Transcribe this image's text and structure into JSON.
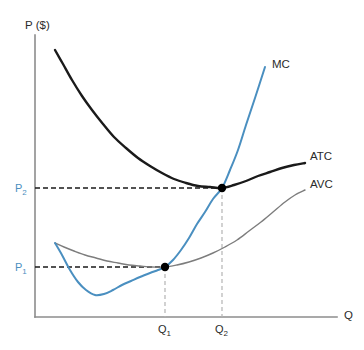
{
  "chart_data": {
    "type": "line",
    "title": "",
    "xlabel": "Q",
    "ylabel": "P ($)",
    "grid": false,
    "legend_position": "inline-right-of-curve-ends",
    "axis_labels": {
      "y_axis": "P ($)",
      "x_axis": "Q"
    },
    "tick_labels": {
      "y": [
        "P",
        "P"
      ],
      "y_subscripts": [
        "1",
        "2"
      ],
      "x": [
        "Q",
        "Q"
      ],
      "x_subscripts": [
        "1",
        "2"
      ]
    },
    "series": [
      {
        "name": "MC",
        "label": "MC",
        "color": "#4a8fc0",
        "width": 2.0,
        "description": "Marginal cost curve: falls to a minimum then rises steeply, cutting AVC and ATC at their minima",
        "points": [
          [
            55,
            243
          ],
          [
            62,
            255
          ],
          [
            70,
            270
          ],
          [
            78,
            282
          ],
          [
            86,
            290
          ],
          [
            95,
            295
          ],
          [
            104,
            294
          ],
          [
            113,
            290
          ],
          [
            122,
            285
          ],
          [
            131,
            281
          ],
          [
            140,
            277
          ],
          [
            150,
            273
          ],
          [
            158,
            270
          ],
          [
            165,
            267
          ],
          [
            173,
            260
          ],
          [
            181,
            250
          ],
          [
            189,
            238
          ],
          [
            197,
            224
          ],
          [
            205,
            212
          ],
          [
            213,
            199
          ],
          [
            222,
            188
          ],
          [
            230,
            170
          ],
          [
            238,
            150
          ],
          [
            246,
            125
          ],
          [
            255,
            98
          ],
          [
            265,
            67
          ]
        ]
      },
      {
        "name": "ATC",
        "label": "ATC",
        "color": "#1a1a1a",
        "width": 2.4,
        "description": "Average total cost curve: U-shaped, minimum where MC crosses it at P2, Q2",
        "points": [
          [
            55,
            50
          ],
          [
            63,
            64
          ],
          [
            72,
            80
          ],
          [
            82,
            96
          ],
          [
            92,
            110
          ],
          [
            103,
            124
          ],
          [
            114,
            137
          ],
          [
            126,
            148
          ],
          [
            138,
            158
          ],
          [
            150,
            166
          ],
          [
            162,
            173
          ],
          [
            174,
            179
          ],
          [
            186,
            183
          ],
          [
            198,
            186
          ],
          [
            210,
            187
          ],
          [
            222,
            188
          ],
          [
            234,
            185
          ],
          [
            246,
            181
          ],
          [
            258,
            176
          ],
          [
            270,
            172
          ],
          [
            282,
            168
          ],
          [
            294,
            165
          ],
          [
            305,
            163
          ]
        ]
      },
      {
        "name": "AVC",
        "label": "AVC",
        "color": "#7d7d7d",
        "width": 1.4,
        "description": "Average variable cost curve: U-shaped and below ATC, minimum where MC crosses it at P1, Q1",
        "points": [
          [
            55,
            243
          ],
          [
            64,
            247
          ],
          [
            74,
            251
          ],
          [
            85,
            255
          ],
          [
            96,
            258
          ],
          [
            107,
            261
          ],
          [
            118,
            263
          ],
          [
            129,
            265
          ],
          [
            140,
            266
          ],
          [
            152,
            267
          ],
          [
            165,
            267
          ],
          [
            177,
            265
          ],
          [
            189,
            262
          ],
          [
            201,
            258
          ],
          [
            213,
            253
          ],
          [
            225,
            247
          ],
          [
            237,
            240
          ],
          [
            249,
            231
          ],
          [
            261,
            222
          ],
          [
            273,
            212
          ],
          [
            285,
            202
          ],
          [
            295,
            195
          ],
          [
            305,
            190
          ]
        ]
      }
    ],
    "intersection_points": [
      {
        "name": "MC-AVC-minimum",
        "x_px": 165,
        "y_px": 267,
        "x_label": "Q1",
        "y_label": "P1",
        "color": "#000000",
        "radius": 4.2
      },
      {
        "name": "MC-ATC-minimum",
        "x_px": 222,
        "y_px": 188,
        "x_label": "Q2",
        "y_label": "P2",
        "color": "#000000",
        "radius": 4.2
      }
    ],
    "guide_lines": {
      "horizontal": [
        {
          "name": "P1-guide",
          "y_px": 267,
          "x_from": 35,
          "x_to": 165,
          "color": "#1a1a1a",
          "dash": "5,3"
        },
        {
          "name": "P2-guide",
          "y_px": 188,
          "x_from": 35,
          "x_to": 222,
          "color": "#1a1a1a",
          "dash": "5,3"
        }
      ],
      "vertical": [
        {
          "name": "Q1-guide",
          "x_px": 165,
          "y_from": 267,
          "y_to": 317,
          "color": "#b4b4b4",
          "dash": "4,3"
        },
        {
          "name": "Q2-guide",
          "x_px": 222,
          "y_from": 188,
          "y_to": 317,
          "color": "#b4b4b4",
          "dash": "4,3"
        }
      ]
    },
    "axes": {
      "y_axis": {
        "x_px": 35,
        "y_top": 35,
        "y_bottom": 317,
        "color": "#8c8c8c",
        "width": 1.6
      },
      "x_axis": {
        "y_px": 317,
        "x_left": 35,
        "x_right": 337,
        "color": "#8c8c8c",
        "width": 1.6
      }
    }
  },
  "labels": {
    "y_axis_title": "P ($)",
    "x_axis_title": "Q",
    "mc": "MC",
    "atc": "ATC",
    "avc": "AVC",
    "p1_base": "P",
    "p1_sub": "1",
    "p2_base": "P",
    "p2_sub": "2",
    "q1_base": "Q",
    "q1_sub": "1",
    "q2_base": "Q",
    "q2_sub": "2"
  },
  "colors": {
    "mc": "#4a8fc0",
    "atc": "#1a1a1a",
    "avc": "#7d7d7d",
    "axis": "#8c8c8c",
    "price_label": "#4a8fc0",
    "quantity_label": "#2b2b2b",
    "point": "#000000",
    "background": "#ffffff"
  }
}
